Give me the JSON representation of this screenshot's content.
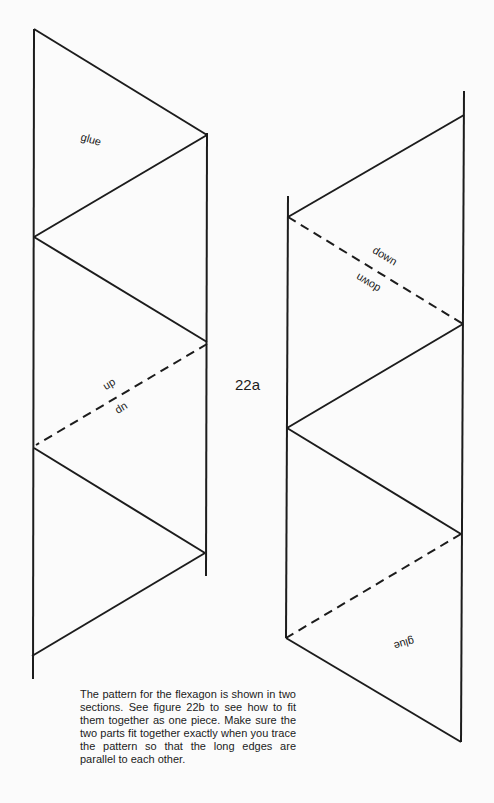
{
  "figure": {
    "label": "22a",
    "caption": "The pattern for the flexagon is shown in two sections. See figure 22b to see how to fit them together as one piece. Make sure the two parts fit together exactly when you trace the pattern so that the long edges are parallel to each other."
  },
  "left_section": {
    "labels": {
      "glue": "glue",
      "fold_upper": "up",
      "fold_lower_inverted": "up"
    }
  },
  "right_section": {
    "labels": {
      "fold_upper": "down",
      "fold_lower_inverted": "down",
      "glue_inverted": "glue"
    }
  },
  "colors": {
    "line": "#1c1c1c",
    "background": "#fbfbfb"
  }
}
